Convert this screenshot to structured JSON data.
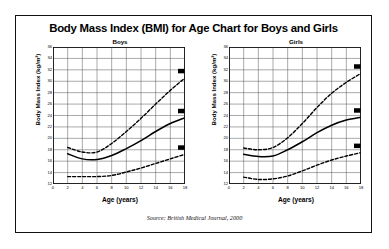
{
  "document": {
    "title": "Body Mass Index (BMI) for Age Chart for Boys and Girls",
    "source": "Source: British Medical Journal, 2000"
  },
  "axis": {
    "ylabel": "Body Mass Index (kg/m²)",
    "xlabel": "Age (years)",
    "yticks": [
      "36",
      "34",
      "32",
      "30",
      "28",
      "26",
      "24",
      "22",
      "20",
      "18",
      "16",
      "14",
      "12"
    ],
    "xticks": [
      "0",
      "2",
      "4",
      "6",
      "8",
      "10",
      "12",
      "14",
      "16",
      "18"
    ]
  },
  "chart_data": [
    {
      "type": "line",
      "title": "Boys",
      "xlabel": "Age (years)",
      "ylabel": "Body Mass Index (kg/m²)",
      "xlim": [
        0,
        18
      ],
      "ylim": [
        12,
        36
      ],
      "grid": true,
      "legend": "none",
      "x": [
        2,
        4,
        6,
        8,
        10,
        12,
        14,
        16,
        18
      ],
      "series": [
        {
          "name": "obese",
          "label": "Obese",
          "style": "dashed",
          "values": [
            18.4,
            17.6,
            17.6,
            19.1,
            21.2,
            23.5,
            26.0,
            28.4,
            30.6
          ]
        },
        {
          "name": "overweight",
          "label": "Overweight",
          "style": "solid",
          "values": [
            17.3,
            16.4,
            16.3,
            17.0,
            18.2,
            19.6,
            21.2,
            22.6,
            23.6
          ]
        },
        {
          "name": "underweight",
          "label": "Underweight",
          "style": "dashed",
          "values": [
            13.3,
            13.3,
            13.3,
            13.5,
            14.1,
            14.8,
            15.6,
            16.4,
            17.2
          ]
        }
      ],
      "annotations": [
        {
          "text": "Obese",
          "x": 18,
          "y": 30.6
        },
        {
          "text": "Overweight",
          "x": 18,
          "y": 23.6
        },
        {
          "text": "Underweight",
          "x": 18,
          "y": 17.2
        }
      ]
    },
    {
      "type": "line",
      "title": "Girls",
      "xlabel": "Age (years)",
      "ylabel": "Body Mass Index (kg/m²)",
      "xlim": [
        0,
        18
      ],
      "ylim": [
        12,
        36
      ],
      "grid": true,
      "legend": "none",
      "x": [
        2,
        4,
        6,
        8,
        10,
        12,
        14,
        16,
        18
      ],
      "series": [
        {
          "name": "obese",
          "label": "Obese",
          "style": "dashed",
          "values": [
            18.3,
            18.0,
            18.4,
            20.1,
            22.6,
            25.4,
            27.9,
            29.8,
            31.4
          ]
        },
        {
          "name": "overweight",
          "label": "Overweight",
          "style": "solid",
          "values": [
            17.2,
            16.8,
            16.9,
            18.0,
            19.4,
            21.0,
            22.3,
            23.2,
            23.7
          ]
        },
        {
          "name": "underweight",
          "label": "Underweight",
          "style": "dashed",
          "values": [
            13.2,
            12.8,
            12.9,
            13.4,
            14.3,
            15.3,
            16.2,
            16.9,
            17.5
          ]
        }
      ],
      "annotations": [
        {
          "text": "Obese",
          "x": 18,
          "y": 31.4
        },
        {
          "text": "Overweight",
          "x": 18,
          "y": 23.7
        },
        {
          "text": "Underweight",
          "x": 18,
          "y": 17.5
        }
      ]
    }
  ]
}
